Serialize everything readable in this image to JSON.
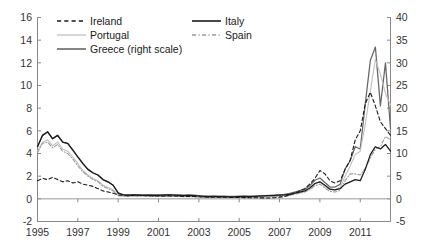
{
  "chart_data": {
    "type": "line",
    "title": "",
    "subtitle": "",
    "xlabel": "",
    "ylabel": "",
    "y2label": "",
    "xlim": [
      1995.0,
      2012.5
    ],
    "ylim": [
      -2,
      16
    ],
    "y2lim": [
      -5,
      40
    ],
    "grid": false,
    "legend_position": "top",
    "xticks": [
      "1995",
      "1997",
      "1999",
      "2001",
      "2003",
      "2005",
      "2007",
      "2009",
      "2011"
    ],
    "xtick_values": [
      1995,
      1997,
      1999,
      2001,
      2003,
      2005,
      2007,
      2009,
      2011
    ],
    "yticks": [
      "-2",
      "0",
      "2",
      "4",
      "6",
      "8",
      "10",
      "12",
      "14",
      "16"
    ],
    "ytick_values": [
      -2,
      0,
      2,
      4,
      6,
      8,
      10,
      12,
      14,
      16
    ],
    "y2ticks": [
      "-5",
      "0",
      "5",
      "10",
      "15",
      "20",
      "25",
      "30",
      "35",
      "40"
    ],
    "y2tick_values": [
      -5,
      0,
      5,
      10,
      15,
      20,
      25,
      30,
      35,
      40
    ],
    "x": [
      1995.0,
      1995.25,
      1995.5,
      1995.75,
      1996.0,
      1996.25,
      1996.5,
      1996.75,
      1997.0,
      1997.25,
      1997.5,
      1997.75,
      1998.0,
      1998.25,
      1998.5,
      1998.75,
      1999.0,
      1999.25,
      1999.5,
      1999.75,
      2000.0,
      2000.25,
      2000.5,
      2000.75,
      2001.0,
      2001.25,
      2001.5,
      2001.75,
      2002.0,
      2002.25,
      2002.5,
      2002.75,
      2003.0,
      2003.25,
      2003.5,
      2003.75,
      2004.0,
      2004.25,
      2004.5,
      2004.75,
      2005.0,
      2005.25,
      2005.5,
      2005.75,
      2006.0,
      2006.25,
      2006.5,
      2006.75,
      2007.0,
      2007.25,
      2007.5,
      2007.75,
      2008.0,
      2008.25,
      2008.5,
      2008.75,
      2009.0,
      2009.25,
      2009.5,
      2009.75,
      2010.0,
      2010.25,
      2010.5,
      2010.75,
      2011.0,
      2011.25,
      2011.5,
      2011.75,
      2012.0,
      2012.25,
      2012.5
    ],
    "series": [
      {
        "name": "Ireland",
        "axis": "left",
        "style": "dashed",
        "color": "#1a1a1a",
        "values": [
          1.6,
          1.8,
          1.7,
          1.9,
          1.7,
          1.5,
          1.6,
          1.4,
          1.5,
          1.3,
          1.2,
          1.1,
          0.9,
          0.7,
          0.6,
          0.5,
          0.35,
          0.3,
          0.28,
          0.3,
          0.32,
          0.3,
          0.28,
          0.26,
          0.25,
          0.24,
          0.26,
          0.25,
          0.24,
          0.22,
          0.2,
          0.2,
          0.18,
          0.16,
          0.15,
          0.16,
          0.15,
          0.14,
          0.13,
          0.12,
          0.12,
          0.11,
          0.1,
          0.1,
          0.09,
          0.08,
          0.08,
          0.1,
          0.15,
          0.2,
          0.35,
          0.5,
          0.7,
          0.9,
          1.3,
          1.8,
          2.5,
          2.2,
          1.6,
          1.4,
          1.6,
          2.6,
          3.4,
          5.2,
          6.0,
          8.4,
          9.4,
          8.2,
          6.8,
          6.2,
          5.6
        ]
      },
      {
        "name": "Italy",
        "axis": "left",
        "style": "solid",
        "color": "#1a1a1a",
        "values": [
          4.6,
          5.6,
          5.9,
          5.3,
          5.6,
          5.0,
          4.9,
          4.3,
          3.7,
          3.1,
          2.6,
          2.3,
          2.1,
          1.7,
          1.5,
          1.2,
          0.5,
          0.35,
          0.32,
          0.34,
          0.33,
          0.3,
          0.32,
          0.3,
          0.3,
          0.32,
          0.34,
          0.33,
          0.3,
          0.28,
          0.3,
          0.28,
          0.25,
          0.22,
          0.2,
          0.22,
          0.2,
          0.2,
          0.18,
          0.18,
          0.2,
          0.22,
          0.2,
          0.22,
          0.24,
          0.26,
          0.28,
          0.3,
          0.33,
          0.35,
          0.4,
          0.5,
          0.6,
          0.7,
          0.95,
          1.35,
          1.5,
          1.2,
          0.85,
          0.8,
          0.9,
          1.3,
          1.5,
          1.7,
          1.6,
          2.6,
          3.9,
          4.6,
          4.4,
          4.8,
          4.2
        ]
      },
      {
        "name": "Portugal",
        "axis": "left",
        "style": "solid",
        "color": "#c0c0c0",
        "values": [
          4.2,
          5.0,
          5.2,
          4.7,
          5.0,
          4.4,
          4.2,
          3.7,
          3.1,
          2.5,
          2.1,
          1.8,
          1.6,
          1.2,
          1.0,
          0.8,
          0.3,
          0.25,
          0.24,
          0.26,
          0.26,
          0.25,
          0.24,
          0.23,
          0.22,
          0.22,
          0.24,
          0.23,
          0.22,
          0.2,
          0.2,
          0.2,
          0.18,
          0.16,
          0.15,
          0.16,
          0.15,
          0.15,
          0.14,
          0.13,
          0.14,
          0.15,
          0.14,
          0.15,
          0.16,
          0.18,
          0.2,
          0.22,
          0.25,
          0.28,
          0.35,
          0.45,
          0.55,
          0.65,
          0.9,
          1.3,
          1.5,
          1.1,
          0.8,
          0.8,
          1.0,
          2.0,
          2.9,
          3.9,
          4.2,
          6.6,
          9.5,
          12.3,
          11.0,
          9.3,
          8.3
        ]
      },
      {
        "name": "Spain",
        "axis": "left",
        "style": "dashdot",
        "color": "#9a9a9a",
        "values": [
          4.1,
          4.9,
          5.0,
          4.5,
          4.8,
          4.2,
          4.0,
          3.5,
          2.9,
          2.4,
          2.0,
          1.7,
          1.5,
          1.1,
          0.9,
          0.7,
          0.28,
          0.24,
          0.22,
          0.24,
          0.24,
          0.23,
          0.22,
          0.21,
          0.2,
          0.2,
          0.22,
          0.21,
          0.2,
          0.18,
          0.18,
          0.18,
          0.16,
          0.14,
          0.14,
          0.15,
          0.14,
          0.14,
          0.13,
          0.12,
          0.13,
          0.14,
          0.13,
          0.14,
          0.15,
          0.16,
          0.18,
          0.2,
          0.22,
          0.25,
          0.3,
          0.4,
          0.5,
          0.6,
          0.8,
          1.15,
          1.3,
          0.95,
          0.65,
          0.6,
          0.75,
          1.6,
          2.2,
          2.2,
          2.1,
          2.7,
          3.6,
          4.4,
          4.6,
          5.5,
          5.2
        ]
      },
      {
        "name": "Greece (right scale)",
        "axis": "right",
        "style": "solid",
        "color": "#666666",
        "values": [
          11.5,
          14.0,
          14.8,
          13.3,
          14.0,
          12.5,
          12.2,
          10.8,
          9.2,
          7.8,
          6.5,
          5.7,
          5.2,
          4.2,
          3.7,
          3.0,
          1.3,
          0.9,
          0.85,
          0.9,
          0.9,
          0.85,
          0.9,
          0.85,
          0.85,
          0.9,
          0.95,
          0.9,
          0.85,
          0.8,
          0.85,
          0.8,
          0.7,
          0.6,
          0.6,
          0.62,
          0.6,
          0.6,
          0.55,
          0.55,
          0.6,
          0.62,
          0.6,
          0.62,
          0.65,
          0.7,
          0.75,
          0.8,
          0.9,
          1.0,
          1.2,
          1.5,
          1.8,
          2.1,
          2.9,
          4.1,
          4.6,
          3.6,
          2.6,
          2.6,
          3.2,
          6.6,
          8.4,
          11.5,
          11.0,
          21.0,
          30.5,
          33.5,
          20.5,
          30.0,
          15.5
        ]
      }
    ]
  },
  "legend": {
    "entries": [
      {
        "label": "Ireland",
        "style": "dashed",
        "color": "#1a1a1a",
        "col": 0,
        "row": 0
      },
      {
        "label": "Italy",
        "style": "solid",
        "color": "#1a1a1a",
        "col": 1,
        "row": 0
      },
      {
        "label": "Portugal",
        "style": "solid",
        "color": "#c0c0c0",
        "col": 0,
        "row": 1
      },
      {
        "label": "Spain",
        "style": "dashdot",
        "color": "#9a9a9a",
        "col": 1,
        "row": 1
      },
      {
        "label": "Greece (right scale)",
        "style": "solid",
        "color": "#666666",
        "col": 0,
        "row": 2
      }
    ]
  },
  "colors": {
    "axis": "#888888",
    "text": "#333333",
    "background": "#ffffff"
  }
}
